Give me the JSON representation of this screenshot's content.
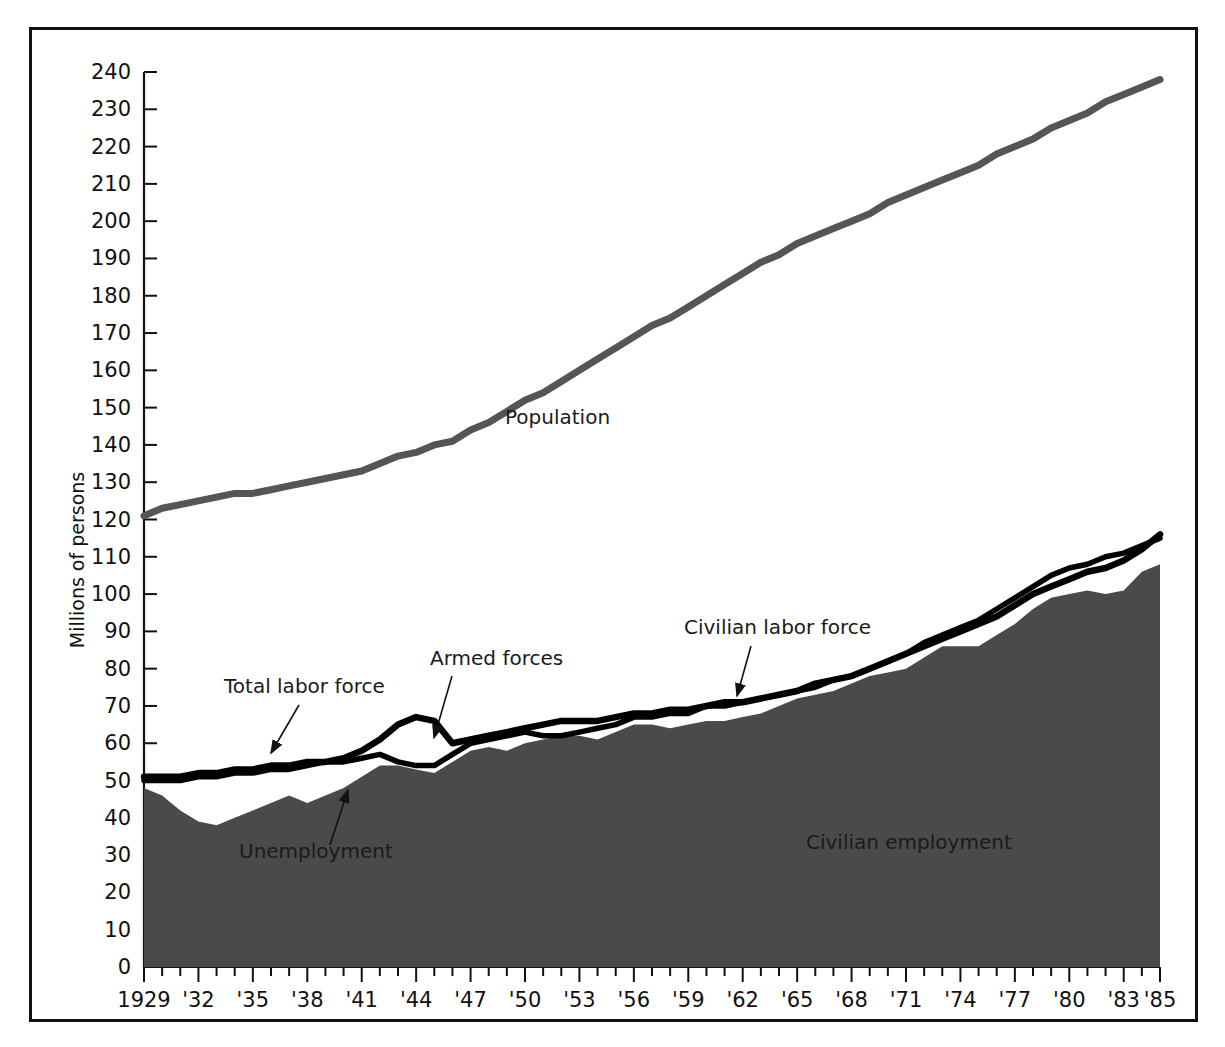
{
  "chart_data": {
    "type": "area",
    "title": "",
    "xlabel": "",
    "ylabel": "Millions of persons",
    "xlim": [
      1929,
      1985
    ],
    "ylim": [
      0,
      245
    ],
    "grid": false,
    "legend_position": "inline-annotations",
    "y_ticks": [
      0,
      10,
      20,
      30,
      40,
      50,
      60,
      70,
      80,
      90,
      100,
      110,
      120,
      130,
      140,
      150,
      160,
      170,
      180,
      190,
      200,
      210,
      220,
      230,
      240
    ],
    "y_tick_labels": [
      "0",
      "10",
      "20",
      "30",
      "40",
      "50",
      "60",
      "70",
      "80",
      "90",
      "100",
      "110",
      "120",
      "130",
      "140",
      "150",
      "160",
      "170",
      "180",
      "190",
      "200",
      "210",
      "220",
      "230",
      "240"
    ],
    "x_ticks": [
      1929,
      1930,
      1931,
      1932,
      1933,
      1934,
      1935,
      1936,
      1937,
      1938,
      1939,
      1940,
      1941,
      1942,
      1943,
      1944,
      1945,
      1946,
      1947,
      1948,
      1949,
      1950,
      1951,
      1952,
      1953,
      1954,
      1955,
      1956,
      1957,
      1958,
      1959,
      1960,
      1961,
      1962,
      1963,
      1964,
      1965,
      1966,
      1967,
      1968,
      1969,
      1970,
      1971,
      1972,
      1973,
      1974,
      1975,
      1976,
      1977,
      1978,
      1979,
      1980,
      1981,
      1982,
      1983,
      1984,
      1985
    ],
    "x_tick_labels": [
      {
        "year": 1929,
        "label": "1929"
      },
      {
        "year": 1932,
        "label": "'32"
      },
      {
        "year": 1935,
        "label": "'35"
      },
      {
        "year": 1938,
        "label": "'38"
      },
      {
        "year": 1941,
        "label": "'41"
      },
      {
        "year": 1944,
        "label": "'44"
      },
      {
        "year": 1947,
        "label": "'47"
      },
      {
        "year": 1950,
        "label": "'50"
      },
      {
        "year": 1953,
        "label": "'53"
      },
      {
        "year": 1956,
        "label": "'56"
      },
      {
        "year": 1959,
        "label": "'59"
      },
      {
        "year": 1962,
        "label": "'62"
      },
      {
        "year": 1965,
        "label": "'65"
      },
      {
        "year": 1968,
        "label": "'68"
      },
      {
        "year": 1971,
        "label": "'71"
      },
      {
        "year": 1974,
        "label": "'74"
      },
      {
        "year": 1977,
        "label": "'77"
      },
      {
        "year": 1980,
        "label": "'80"
      },
      {
        "year": 1983,
        "label": "'83"
      },
      {
        "year": 1985,
        "label": "'85"
      }
    ],
    "x": [
      1929,
      1930,
      1931,
      1932,
      1933,
      1934,
      1935,
      1936,
      1937,
      1938,
      1939,
      1940,
      1941,
      1942,
      1943,
      1944,
      1945,
      1946,
      1947,
      1948,
      1949,
      1950,
      1951,
      1952,
      1953,
      1954,
      1955,
      1956,
      1957,
      1958,
      1959,
      1960,
      1961,
      1962,
      1963,
      1964,
      1965,
      1966,
      1967,
      1968,
      1969,
      1970,
      1971,
      1972,
      1973,
      1974,
      1975,
      1976,
      1977,
      1978,
      1979,
      1980,
      1981,
      1982,
      1983,
      1984,
      1985
    ],
    "series": [
      {
        "name": "Population",
        "color": "#555555",
        "style": "thick-gray-line",
        "values": [
          121,
          123,
          124,
          125,
          126,
          127,
          127,
          128,
          129,
          130,
          131,
          132,
          133,
          135,
          137,
          138,
          140,
          141,
          144,
          146,
          149,
          152,
          154,
          157,
          160,
          163,
          166,
          169,
          172,
          174,
          177,
          180,
          183,
          186,
          189,
          191,
          194,
          196,
          198,
          200,
          202,
          205,
          207,
          209,
          211,
          213,
          215,
          218,
          220,
          222,
          225,
          227,
          229,
          232,
          234,
          236,
          238
        ]
      },
      {
        "name": "Total labor force",
        "color": "#000000",
        "style": "thick-black-line",
        "values": [
          51,
          51,
          51,
          52,
          52,
          53,
          53,
          54,
          54,
          55,
          55,
          56,
          58,
          61,
          65,
          67,
          66,
          60,
          61,
          62,
          63,
          64,
          65,
          66,
          66,
          66,
          67,
          68,
          68,
          69,
          69,
          70,
          71,
          71,
          72,
          73,
          74,
          76,
          77,
          78,
          80,
          82,
          84,
          86,
          88,
          90,
          92,
          94,
          97,
          100,
          102,
          104,
          106,
          107,
          109,
          112,
          116
        ]
      },
      {
        "name": "Civilian labor force",
        "color": "#000000",
        "style": "thin-black-line",
        "values": [
          50,
          50,
          50,
          51,
          51,
          52,
          52,
          53,
          53,
          54,
          55,
          55,
          56,
          57,
          55,
          54,
          54,
          57,
          60,
          61,
          62,
          63,
          62,
          62,
          63,
          64,
          65,
          67,
          67,
          68,
          68,
          70,
          70,
          71,
          72,
          73,
          74,
          75,
          77,
          78,
          80,
          82,
          84,
          87,
          89,
          91,
          93,
          96,
          99,
          102,
          105,
          107,
          108,
          110,
          111,
          113,
          115
        ]
      },
      {
        "name": "Civilian employment",
        "color": "#4a4a4a",
        "style": "dark-gray-filled-area",
        "values": [
          48,
          46,
          42,
          39,
          38,
          40,
          42,
          44,
          46,
          44,
          46,
          48,
          51,
          54,
          54,
          53,
          52,
          55,
          58,
          59,
          58,
          60,
          61,
          62,
          62,
          61,
          63,
          65,
          65,
          64,
          65,
          66,
          66,
          67,
          68,
          70,
          72,
          73,
          74,
          76,
          78,
          79,
          80,
          83,
          86,
          86,
          86,
          89,
          92,
          96,
          99,
          100,
          101,
          100,
          101,
          106,
          108
        ]
      },
      {
        "name": "Armed forces",
        "derived": "total_labor_force minus civilian_labor_force",
        "values": [
          1,
          1,
          1,
          1,
          1,
          1,
          1,
          1,
          1,
          1,
          0,
          1,
          2,
          4,
          10,
          13,
          12,
          3,
          1,
          1,
          1,
          1,
          3,
          4,
          3,
          2,
          2,
          1,
          1,
          1,
          1,
          0,
          1,
          0,
          0,
          0,
          0,
          1,
          0,
          0,
          0,
          0,
          0,
          -1,
          -1,
          -1,
          -1,
          -2,
          -2,
          -2,
          -3,
          -3,
          -2,
          -3,
          -2,
          -1,
          1
        ]
      },
      {
        "name": "Unemployment",
        "derived": "civilian_labor_force minus civilian_employment",
        "values": [
          2,
          4,
          8,
          12,
          13,
          12,
          10,
          9,
          7,
          10,
          9,
          7,
          5,
          3,
          1,
          1,
          2,
          2,
          2,
          2,
          4,
          3,
          1,
          0,
          1,
          3,
          2,
          2,
          2,
          4,
          3,
          4,
          4,
          4,
          4,
          3,
          2,
          2,
          3,
          2,
          2,
          3,
          4,
          4,
          3,
          5,
          7,
          7,
          7,
          6,
          6,
          7,
          7,
          10,
          10,
          7,
          7
        ]
      }
    ],
    "annotations": [
      {
        "id": "population",
        "text": "Population",
        "x": 505,
        "y": 424
      },
      {
        "id": "total-labor-force",
        "text": "Total labor force",
        "x": 224,
        "y": 693,
        "leader": {
          "x1": 299,
          "y1": 705,
          "x2": 271,
          "y2": 753
        }
      },
      {
        "id": "armed-forces",
        "text": "Armed forces",
        "x": 430,
        "y": 665,
        "leader": {
          "x1": 452,
          "y1": 676,
          "x2": 434,
          "y2": 738
        }
      },
      {
        "id": "civilian-labor-force",
        "text": "Civilian labor force",
        "x": 684,
        "y": 634,
        "leader": {
          "x1": 751,
          "y1": 646,
          "x2": 737,
          "y2": 696
        }
      },
      {
        "id": "unemployment",
        "text": "Unemployment",
        "x": 239,
        "y": 858,
        "leader": {
          "x1": 330,
          "y1": 845,
          "x2": 348,
          "y2": 790
        }
      },
      {
        "id": "civilian-employment",
        "text": "Civilian employment",
        "x": 806,
        "y": 849
      }
    ]
  },
  "colors": {
    "population_line": "#555555",
    "labor_force_line": "#000000",
    "employment_fill": "#4a4a4a",
    "frame": "#111111",
    "background": "#ffffff"
  }
}
